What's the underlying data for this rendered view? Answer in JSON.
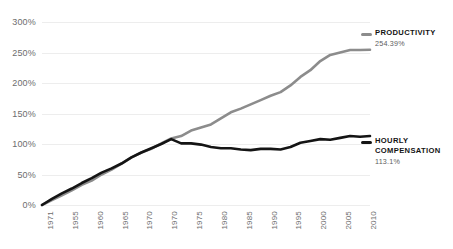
{
  "chart_data": {
    "type": "line",
    "title": "",
    "subtitle": "",
    "xlabel": "",
    "ylabel": "",
    "grid": true,
    "legend_position": "right-inline-annotations",
    "xlim": [
      1947,
      2013
    ],
    "ylim": [
      0,
      300
    ],
    "y_ticks": [
      "0%",
      "50%",
      "100%",
      "150%",
      "200%",
      "250%",
      "300%"
    ],
    "y_tick_values": [
      0,
      50,
      100,
      150,
      200,
      250,
      300
    ],
    "x_tick_labels": [
      "1971",
      "1955",
      "1960",
      "1965",
      "1970",
      "1970",
      "1975",
      "1980",
      "1985",
      "1990",
      "1995",
      "2000",
      "2005",
      "2010"
    ],
    "x_tick_values": [
      1947,
      1952,
      1957,
      1962,
      1967,
      1972,
      1977,
      1982,
      1987,
      1992,
      1997,
      2002,
      2007,
      2012
    ],
    "series": [
      {
        "name": "PRODUCTIVITY",
        "end_label": "254.39%",
        "color": "#8c8c8c",
        "x": [
          1947,
          1949,
          1951,
          1953,
          1955,
          1957,
          1959,
          1961,
          1963,
          1965,
          1967,
          1969,
          1971,
          1973,
          1975,
          1977,
          1979,
          1981,
          1983,
          1985,
          1987,
          1989,
          1991,
          1993,
          1995,
          1997,
          1999,
          2001,
          2003,
          2005,
          2007,
          2009,
          2011,
          2013
        ],
        "values": [
          0,
          8,
          16,
          24,
          33,
          40,
          50,
          58,
          68,
          78,
          86,
          92,
          101,
          109,
          113,
          122,
          127,
          132,
          142,
          152,
          158,
          165,
          172,
          179,
          185,
          196,
          210,
          221,
          236,
          246,
          250,
          254,
          254,
          254.39
        ]
      },
      {
        "name": "HOURLY COMPENSATION",
        "end_label": "113.1%",
        "color": "#141414",
        "x": [
          1947,
          1949,
          1951,
          1953,
          1955,
          1957,
          1959,
          1961,
          1963,
          1965,
          1967,
          1969,
          1971,
          1973,
          1975,
          1977,
          1979,
          1981,
          1983,
          1985,
          1987,
          1989,
          1991,
          1993,
          1995,
          1997,
          1999,
          2001,
          2003,
          2005,
          2007,
          2009,
          2011,
          2013
        ],
        "values": [
          0,
          10,
          19,
          27,
          36,
          44,
          53,
          60,
          68,
          78,
          86,
          93,
          100,
          108,
          101,
          101,
          99,
          95,
          93,
          93,
          91,
          90,
          92,
          92,
          91,
          95,
          102,
          105,
          108,
          107,
          110,
          113,
          112,
          113.1
        ]
      }
    ]
  },
  "annotations": {
    "productivity": {
      "name": "PRODUCTIVITY",
      "value": "254.39%",
      "color": "#8c8c8c"
    },
    "compensation": {
      "name_line1": "HOURLY",
      "name_line2": "COMPENSATION",
      "value": "113.1%",
      "color": "#141414"
    }
  },
  "colors": {
    "productivity": "#8c8c8c",
    "compensation": "#141414",
    "gridline": "#ededed",
    "tick_text": "#6d6d6d",
    "background": "#ffffff"
  }
}
